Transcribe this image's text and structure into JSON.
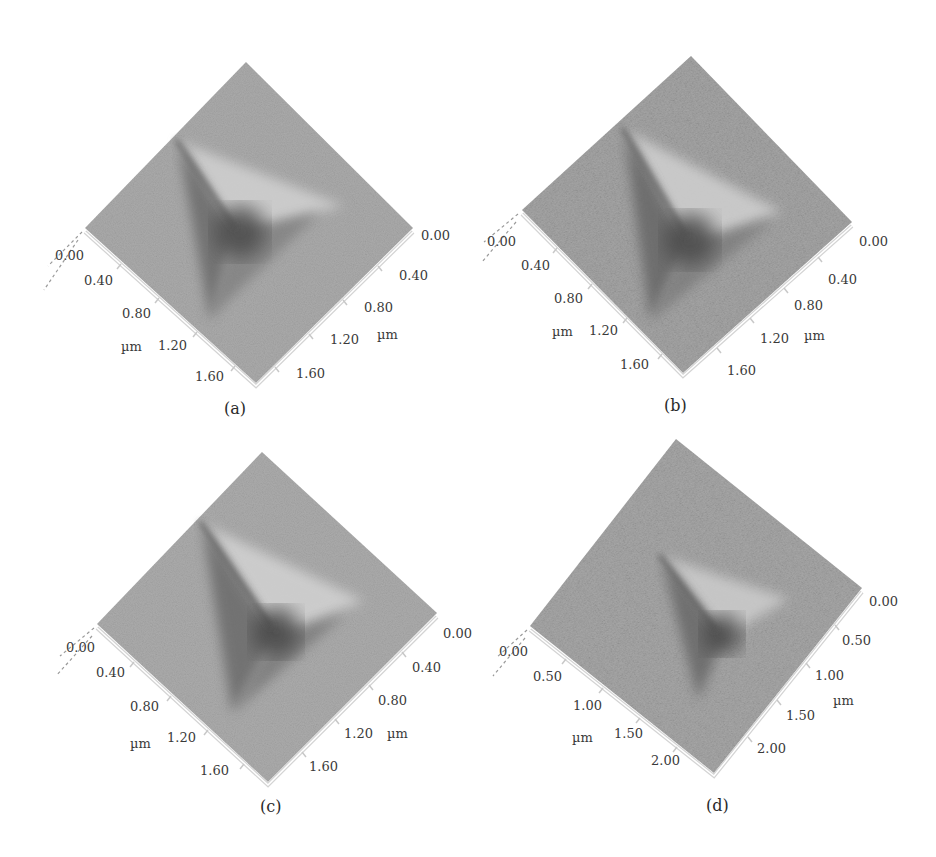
{
  "figure": {
    "surface_color": "#a9a9a9",
    "surface_light": "#c4c4c4",
    "indent_dark": "#4e4e4e",
    "indent_ridge": "#d2d2d2",
    "panels": [
      {
        "id": "a",
        "caption": "(a)",
        "unit_left": "µm",
        "unit_right": "µm",
        "left_axis_ticks": [
          "0.00",
          "0.40",
          "0.80",
          "1.20",
          "1.60"
        ],
        "right_axis_ticks": [
          "0.00",
          "0.40",
          "0.80",
          "1.20",
          "1.60"
        ]
      },
      {
        "id": "b",
        "caption": "(b)",
        "unit_left": "µm",
        "unit_right": "µm",
        "left_axis_ticks": [
          "0.00",
          "0.40",
          "0.80",
          "1.20",
          "1.60"
        ],
        "right_axis_ticks": [
          "0.00",
          "0.40",
          "0.80",
          "1.20",
          "1.60"
        ]
      },
      {
        "id": "c",
        "caption": "(c)",
        "unit_left": "µm",
        "unit_right": "µm",
        "left_axis_ticks": [
          "0.00",
          "0.40",
          "0.80",
          "1.20",
          "1.60"
        ],
        "right_axis_ticks": [
          "0.00",
          "0.40",
          "0.80",
          "1.20",
          "1.60"
        ]
      },
      {
        "id": "d",
        "caption": "(d)",
        "unit_left": "µm",
        "unit_right": "µm",
        "left_axis_ticks": [
          "0.00",
          "0.50",
          "1.00",
          "1.50",
          "2.00"
        ],
        "right_axis_ticks": [
          "0.00",
          "0.50",
          "1.00",
          "1.50",
          "2.00"
        ]
      }
    ]
  }
}
